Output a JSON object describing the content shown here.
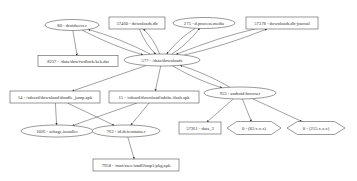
{
  "diagram": {
    "type": "directed-graph",
    "colors": {
      "stroke": "#555555",
      "text": "#333333",
      "background": "#ffffff"
    },
    "nodes": [
      {
        "id": "n80",
        "label": "80 - droidserver",
        "shape": "ellipse",
        "x": 72,
        "y": 25,
        "w": 54,
        "h": 11
      },
      {
        "id": "n57460",
        "label": "57460 - downloads.db",
        "shape": "box",
        "x": 137,
        "y": 23,
        "w": 56,
        "h": 12
      },
      {
        "id": "n275",
        "label": "275 - d.process.media",
        "shape": "ellipse",
        "x": 204,
        "y": 23,
        "w": 62,
        "h": 11
      },
      {
        "id": "n57378",
        "label": "57378 - downloads.db-journal",
        "shape": "box",
        "x": 282,
        "y": 23,
        "w": 72,
        "h": 12
      },
      {
        "id": "n8237",
        "label": "8237 - /data/drm/fwdlock/kek.dat",
        "shape": "box",
        "x": 78,
        "y": 61,
        "w": 80,
        "h": 11
      },
      {
        "id": "n577",
        "label": "577 - /data/downloads",
        "shape": "ellipse",
        "x": 162,
        "y": 60,
        "w": 76,
        "h": 12
      },
      {
        "id": "n14",
        "label": "14 - /sdcard/download/doodle_jump.apk",
        "shape": "box",
        "x": 55,
        "y": 97,
        "w": 90,
        "h": 12
      },
      {
        "id": "n15",
        "label": "15 - /sdcard/download/adobe.flash.apk",
        "shape": "box",
        "x": 154,
        "y": 97,
        "w": 90,
        "h": 12
      },
      {
        "id": "n953",
        "label": "953 - android.browser",
        "shape": "ellipse",
        "x": 240,
        "y": 93,
        "w": 72,
        "h": 12
      },
      {
        "id": "n1026",
        "label": "1026 - ackage.installer",
        "shape": "ellipse",
        "x": 57,
        "y": 131,
        "w": 72,
        "h": 12
      },
      {
        "id": "n762",
        "label": "762 - id.defcontainer",
        "shape": "ellipse",
        "x": 126,
        "y": 131,
        "w": 68,
        "h": 12
      },
      {
        "id": "n57361",
        "label": "57361 - data_3",
        "shape": "box",
        "x": 200,
        "y": 128,
        "w": 42,
        "h": 12
      },
      {
        "id": "n0a",
        "label": "0 - (82.x.x.x)",
        "shape": "hexagon",
        "x": 254,
        "y": 128,
        "w": 54,
        "h": 13
      },
      {
        "id": "n0b",
        "label": "0 - (215.x.x.x)",
        "shape": "hexagon",
        "x": 316,
        "y": 128,
        "w": 58,
        "h": 13
      },
      {
        "id": "n7958",
        "label": "7958 - /mnt/asec/smdl2tmp1/pkg.apk",
        "shape": "box",
        "x": 136,
        "y": 165,
        "w": 86,
        "h": 12
      }
    ],
    "edges": [
      {
        "from": "n80",
        "to": "n8237"
      },
      {
        "from": "n80",
        "to": "n577"
      },
      {
        "from": "n577",
        "to": "n80"
      },
      {
        "from": "n57460",
        "to": "n577"
      },
      {
        "from": "n577",
        "to": "n57460"
      },
      {
        "from": "n275",
        "to": "n577"
      },
      {
        "from": "n577",
        "to": "n275"
      },
      {
        "from": "n57378",
        "to": "n577"
      },
      {
        "from": "n577",
        "to": "n57378"
      },
      {
        "from": "n577",
        "to": "n14"
      },
      {
        "from": "n577",
        "to": "n15"
      },
      {
        "from": "n577",
        "to": "n953"
      },
      {
        "from": "n953",
        "to": "n577"
      },
      {
        "from": "n14",
        "to": "n1026"
      },
      {
        "from": "n14",
        "to": "n762"
      },
      {
        "from": "n15",
        "to": "n1026"
      },
      {
        "from": "n15",
        "to": "n762"
      },
      {
        "from": "n762",
        "to": "n7958"
      },
      {
        "from": "n953",
        "to": "n57361"
      },
      {
        "from": "n953",
        "to": "n0a"
      },
      {
        "from": "n953",
        "to": "n0b"
      }
    ]
  }
}
